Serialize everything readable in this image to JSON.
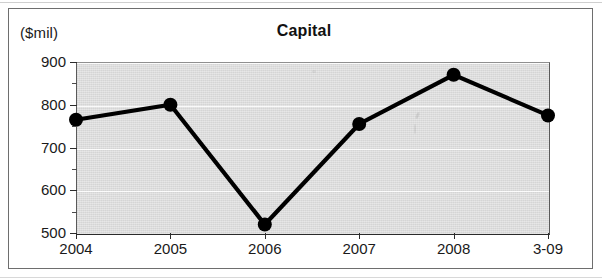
{
  "figure": {
    "unit_label": "($mil)",
    "title": "Capital"
  },
  "chart_data": {
    "type": "line",
    "title": "Capital",
    "subtitle": "",
    "xlabel": "",
    "ylabel": "($mil)",
    "unit": "$mil",
    "categories": [
      "2004",
      "2005",
      "2006",
      "2007",
      "2008",
      "3-09"
    ],
    "values": [
      765,
      800,
      520,
      755,
      870,
      775
    ],
    "series": [
      {
        "name": "Capital",
        "values": [
          765,
          800,
          520,
          755,
          870,
          775
        ]
      }
    ],
    "ylim": [
      500,
      900
    ],
    "ytick_labels": [
      "500",
      "600",
      "700",
      "800",
      "900"
    ],
    "ytick_values": [
      500,
      600,
      700,
      800,
      900
    ],
    "yminor_values": [
      550,
      650,
      750,
      850
    ],
    "xtick_labels": [
      "2004",
      "2005",
      "2006",
      "2007",
      "2008",
      "3-09"
    ],
    "grid": true,
    "legend": "none",
    "marker": "filled-circle",
    "line_color": "#000000",
    "marker_color": "#000000",
    "plot_background": "#dcdcdc"
  },
  "axis": {
    "y_labels": [
      "900",
      "800",
      "700",
      "600",
      "500"
    ],
    "x_labels": [
      "2004",
      "2005",
      "2006",
      "2007",
      "2008",
      "3-09"
    ]
  }
}
